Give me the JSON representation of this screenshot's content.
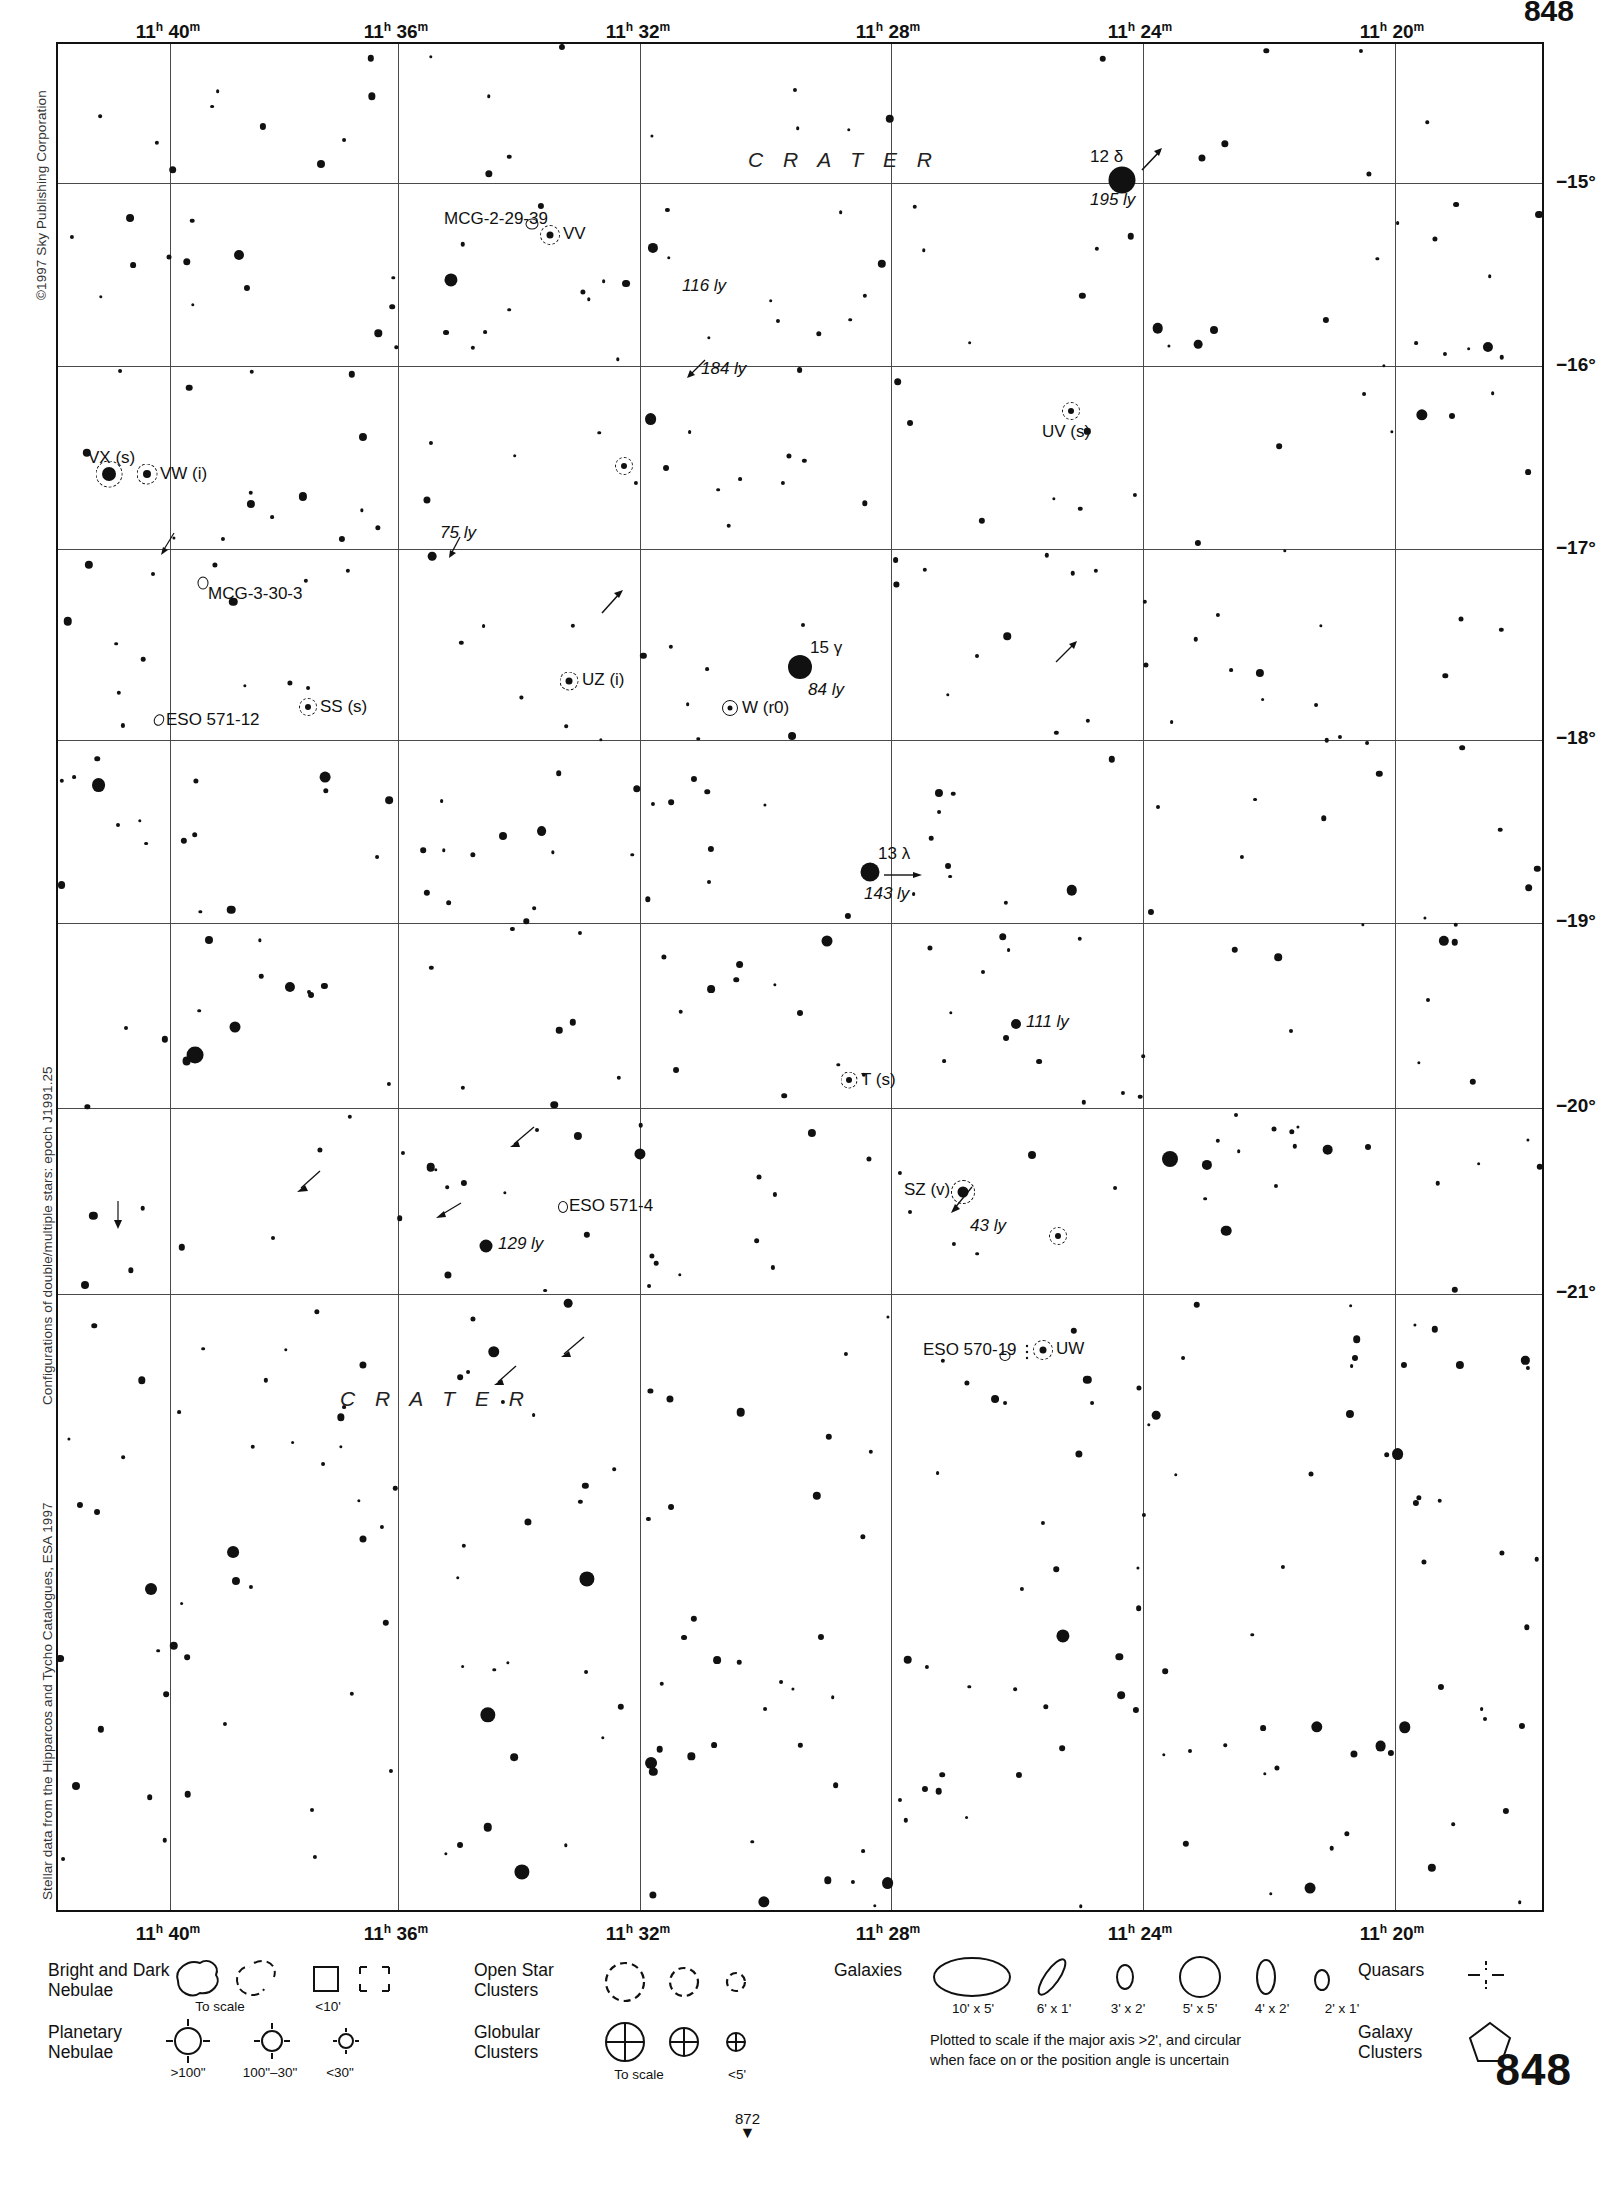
{
  "page": {
    "page_number": "848",
    "continuation_number": "872",
    "copyright_top_left": "©1997 Sky Publishing Corporation",
    "credit_mid_left": "Configurations of double/multiple stars: epoch J1991.25",
    "credit_bottom_left": "Stellar data from the Hipparcos and Tycho Catalogues, ESA 1997"
  },
  "chart_data": {
    "type": "scatter",
    "xlabel": "Right Ascension",
    "ylabel": "Declination",
    "xlim": [
      "11h 42m",
      "11h 19m"
    ],
    "ylim": [
      "-14.3",
      "-21.4"
    ],
    "grid": true,
    "ra_ticks": [
      {
        "label": "11h 40m",
        "h": "11",
        "m": "40"
      },
      {
        "label": "11h 36m",
        "h": "11",
        "m": "36"
      },
      {
        "label": "11h 32m",
        "h": "11",
        "m": "32"
      },
      {
        "label": "11h 28m",
        "h": "11",
        "m": "28"
      },
      {
        "label": "11h 24m",
        "h": "11",
        "m": "24"
      },
      {
        "label": "11h 20m",
        "h": "11",
        "m": "20"
      }
    ],
    "dec_ticks": [
      "−15°",
      "−16°",
      "−17°",
      "−18°",
      "−19°",
      "−20°",
      "−21°"
    ],
    "constellation_labels": [
      {
        "name": "C R A T E R",
        "x": 750,
        "y": 118
      },
      {
        "name": "C R A T E R",
        "x": 340,
        "y": 1355
      },
      {
        "name": "CRATER_top_dup",
        "x": -1000,
        "y": -1000
      }
    ],
    "labeled_objects": [
      {
        "id": "12-delta",
        "label": "12 δ",
        "distance": "195 ly",
        "x": 1064,
        "y": 136,
        "mag_size": 25,
        "has_pm_arrow": true
      },
      {
        "id": "VV",
        "label": "VV",
        "type": "variable",
        "x": 543,
        "y": 235
      },
      {
        "id": "MCG-2-29-39",
        "label": "MCG-2-29-39",
        "type": "galaxy",
        "x": 530,
        "y": 222
      },
      {
        "id": "dist-116",
        "distance": "116 ly",
        "x": 694,
        "y": 281
      },
      {
        "id": "dist-184",
        "distance": "184 ly",
        "x": 700,
        "y": 366
      },
      {
        "id": "UV",
        "label": "UV (s)",
        "type": "variable",
        "x": 1065,
        "y": 411
      },
      {
        "id": "VX",
        "label": "VX (s)",
        "type": "variable",
        "x": 107,
        "y": 473
      },
      {
        "id": "VW",
        "label": "VW (i)",
        "type": "variable",
        "x": 142,
        "y": 470
      },
      {
        "id": "dist-75",
        "distance": "75 ly",
        "x": 452,
        "y": 531
      },
      {
        "id": "MCG-3-30-3",
        "label": "MCG-3-30-3",
        "type": "galaxy",
        "x": 197,
        "y": 588
      },
      {
        "id": "UZ",
        "label": "UZ (i)",
        "type": "variable",
        "x": 563,
        "y": 684
      },
      {
        "id": "15-gamma",
        "label": "15 γ",
        "distance": "84 ly",
        "x": 797,
        "y": 668,
        "mag_size": 22
      },
      {
        "id": "W",
        "label": "W (r0)",
        "type": "variable",
        "x": 724,
        "y": 711
      },
      {
        "id": "ESO-571-12",
        "label": "ESO 571-12",
        "type": "galaxy",
        "x": 155,
        "y": 722
      },
      {
        "id": "SS",
        "label": "SS (s)",
        "type": "variable",
        "x": 302,
        "y": 711
      },
      {
        "id": "13-lambda",
        "label": "13 λ",
        "distance": "143 ly",
        "x": 864,
        "y": 873,
        "mag_size": 17,
        "has_pm_arrow": true
      },
      {
        "id": "dist-111",
        "distance": "111 ly",
        "x": 1010,
        "y": 1027
      },
      {
        "id": "T",
        "label": "T (s)",
        "type": "variable",
        "x": 843,
        "y": 1083
      },
      {
        "id": "ESO-571-4",
        "label": "ESO 571-4",
        "type": "galaxy",
        "x": 561,
        "y": 1206
      },
      {
        "id": "SZ",
        "label": "SZ (v)",
        "distance": "43 ly",
        "type": "variable",
        "x": 957,
        "y": 1192
      },
      {
        "id": "dist-129",
        "distance": "129 ly",
        "x": 484,
        "y": 1245
      },
      {
        "id": "UW",
        "label": "UW",
        "type": "variable",
        "x": 1039,
        "y": 1348
      },
      {
        "id": "ESO-570-19",
        "label": "ESO 570-19",
        "type": "galaxy",
        "x": 1003,
        "y": 1353
      }
    ]
  },
  "legend": {
    "bright_dark_nebulae": {
      "title": "Bright and Dark\nNebulae",
      "sub_to_scale": "To scale",
      "sub_small": "<10'"
    },
    "planetary_nebulae": {
      "title": "Planetary\nNebulae",
      "sizes": [
        ">100\"",
        "100\"–30\"",
        "<30\""
      ]
    },
    "open_star_clusters": {
      "title": "Open Star\nClusters"
    },
    "globular_clusters": {
      "title": "Globular\nClusters",
      "sub_to_scale": "To scale",
      "sub_small": "<5'"
    },
    "galaxies": {
      "title": "Galaxies",
      "sizes": [
        "10' x 5'",
        "6' x 1'",
        "3' x 2'",
        "5' x 5'",
        "4' x 2'",
        "2' x 1'"
      ],
      "note": "Plotted to scale if the major axis >2', and circular\nwhen face on or the position angle is uncertain"
    },
    "quasars": {
      "title": "Quasars"
    },
    "galaxy_clusters": {
      "title": "Galaxy\nClusters"
    }
  }
}
